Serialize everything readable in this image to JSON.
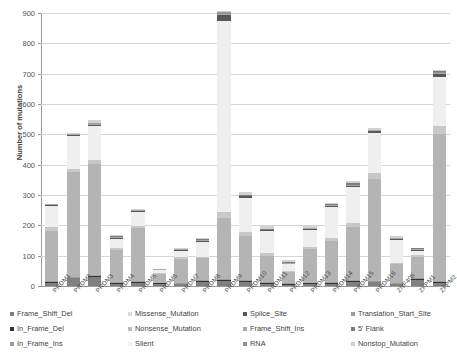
{
  "chart_data": {
    "type": "bar",
    "subtype": "stacked-bar",
    "title": "",
    "xlabel": "",
    "ylabel": "Number of mutations",
    "ylim": [
      0,
      900
    ],
    "ytick_values": [
      0,
      100,
      200,
      300,
      400,
      500,
      600,
      700,
      800,
      900
    ],
    "ytick_labels": [
      "0",
      "100",
      "200",
      "300",
      "400",
      "500",
      "600",
      "700",
      "800",
      "900"
    ],
    "grid": true,
    "legend_position": "bottom",
    "categories": [
      "PRDM1",
      "PRDM2",
      "PRDM3",
      "PRDM4",
      "PRDM5",
      "PRDM6",
      "PRDM7",
      "PRDM8",
      "PRDM9",
      "PRDM10",
      "PRDM11",
      "PRDM12",
      "PRDM13",
      "PRDM14",
      "PRDM15",
      "PRDM16",
      "ZNF408",
      "ZFPM1",
      "ZFPM2"
    ],
    "series": [
      {
        "name": "Frame_Shift_Del",
        "color": "#808080",
        "values": [
          10,
          25,
          30,
          8,
          10,
          6,
          5,
          14,
          18,
          13,
          7,
          4,
          6,
          7,
          14,
          12,
          5,
          20,
          10
        ]
      },
      {
        "name": "In_Frame_Del",
        "color": "#333333",
        "values": [
          2,
          2,
          2,
          1,
          2,
          1,
          1,
          2,
          3,
          2,
          1,
          1,
          1,
          1,
          2,
          2,
          1,
          2,
          3
        ]
      },
      {
        "name": "In_Frame_Ins",
        "color": "#9e9e9e",
        "values": [
          1,
          1,
          1,
          1,
          1,
          1,
          1,
          1,
          2,
          1,
          1,
          1,
          1,
          1,
          1,
          1,
          1,
          1,
          1
        ]
      },
      {
        "name": "Missense_Mutation",
        "color": "#b4b4b4",
        "values": [
          166,
          345,
          367,
          107,
          175,
          28,
          80,
          72,
          202,
          148,
          87,
          36,
          110,
          135,
          175,
          334,
          62,
          72,
          487
        ]
      },
      {
        "name": "Nonsense_Mutation",
        "color": "#c8c8c8",
        "values": [
          13,
          12,
          14,
          6,
          8,
          3,
          5,
          6,
          20,
          13,
          9,
          3,
          8,
          10,
          13,
          22,
          5,
          6,
          24
        ]
      },
      {
        "name": "Silent",
        "color": "#efefef",
        "values": [
          68,
          108,
          110,
          30,
          47,
          9,
          20,
          48,
          628,
          110,
          72,
          23,
          55,
          103,
          118,
          130,
          74,
          13,
          163
        ]
      },
      {
        "name": "Splice_Site",
        "color": "#585858",
        "values": [
          4,
          4,
          5,
          2,
          3,
          1,
          2,
          3,
          20,
          6,
          3,
          1,
          3,
          4,
          5,
          7,
          3,
          2,
          9
        ]
      },
      {
        "name": "Frame_Shift_Ins",
        "color": "#a8a8a8",
        "values": [
          2,
          2,
          2,
          1,
          1,
          1,
          1,
          1,
          3,
          2,
          1,
          1,
          1,
          1,
          2,
          2,
          1,
          1,
          3
        ]
      },
      {
        "name": "RNA",
        "color": "#8f8f8f",
        "values": [
          0,
          0,
          0,
          0,
          0,
          0,
          0,
          0,
          1,
          0,
          0,
          0,
          0,
          0,
          0,
          0,
          0,
          0,
          1
        ]
      },
      {
        "name": "Translation_Start_Site",
        "color": "#9c9c9c",
        "values": [
          0,
          0,
          1,
          0,
          0,
          0,
          0,
          0,
          1,
          0,
          0,
          0,
          0,
          0,
          0,
          0,
          0,
          0,
          1
        ]
      },
      {
        "name": "5' Flank",
        "color": "#7d7d7d",
        "values": [
          0,
          0,
          1,
          1,
          0,
          0,
          1,
          2,
          1,
          2,
          2,
          2,
          2,
          2,
          6,
          3,
          2,
          1,
          2
        ]
      },
      {
        "name": "Nonstop_Mutation",
        "color": "#d2d2d2",
        "values": [
          0,
          1,
          7,
          1,
          1,
          0,
          1,
          6,
          1,
          8,
          9,
          8,
          6,
          4,
          7,
          4,
          6,
          0,
          1
        ]
      }
    ],
    "totals": [
      266,
      500,
      540,
      158,
      248,
      50,
      117,
      155,
      900,
      305,
      192,
      80,
      193,
      268,
      343,
      517,
      160,
      118,
      705
    ]
  },
  "legend": {
    "items": [
      {
        "label": "Frame_Shift_Del",
        "color": "#808080"
      },
      {
        "label": "In_Frame_Del",
        "color": "#333333"
      },
      {
        "label": "In_Frame_Ins",
        "color": "#9e9e9e"
      },
      {
        "label": "Missense_Mutation",
        "color": "#dcdcdc"
      },
      {
        "label": "Nonsense_Mutation",
        "color": "#bdbdbd"
      },
      {
        "label": "Silent",
        "color": "#f2f2f2"
      },
      {
        "label": "Splice_Site",
        "color": "#585858"
      },
      {
        "label": "Frame_Shift_Ins",
        "color": "#a8a8a8"
      },
      {
        "label": "RNA",
        "color": "#8f8f8f"
      },
      {
        "label": "Translation_Start_Site",
        "color": "#9c9c9c"
      },
      {
        "label": "5' Flank",
        "color": "#7d7d7d"
      },
      {
        "label": "Nonstop_Mutation",
        "color": "#d2d2d2"
      }
    ]
  }
}
